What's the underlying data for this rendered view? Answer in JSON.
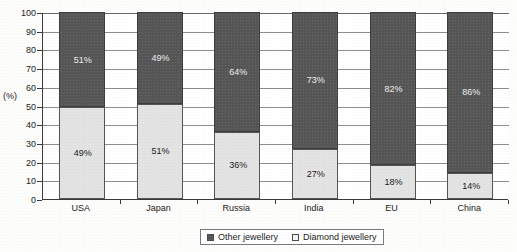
{
  "chart_data": {
    "type": "bar",
    "subtype": "100% stacked column",
    "title": "",
    "xlabel": "",
    "ylabel": "(%)",
    "ylim": [
      0,
      100
    ],
    "yticks": [
      0,
      10,
      20,
      30,
      40,
      50,
      60,
      70,
      80,
      90,
      100
    ],
    "grid": true,
    "legend_position": "bottom-center",
    "categories": [
      "USA",
      "Japan",
      "Russia",
      "India",
      "EU",
      "China"
    ],
    "series": [
      {
        "name": "Other jewellery",
        "color": "#565656",
        "values": [
          51,
          49,
          64,
          73,
          82,
          86
        ],
        "labels": [
          "51%",
          "49%",
          "64%",
          "73%",
          "82%",
          "86%"
        ]
      },
      {
        "name": "Diamond jewellery",
        "color": "#e3e3e3",
        "values": [
          49,
          51,
          36,
          27,
          18,
          14
        ],
        "labels": [
          "49%",
          "51%",
          "36%",
          "27%",
          "18%",
          "14%"
        ]
      }
    ]
  },
  "axis": {
    "y_title": "(%)",
    "y_tick_labels": [
      "100",
      "90",
      "80",
      "70",
      "60",
      "50",
      "40",
      "30",
      "20",
      "10",
      "0"
    ]
  },
  "legend": {
    "items": [
      {
        "label": "Other jewellery",
        "swatch": "dark-gray-swatch"
      },
      {
        "label": "Diamond jewellery",
        "swatch": "light-gray-swatch"
      }
    ]
  }
}
